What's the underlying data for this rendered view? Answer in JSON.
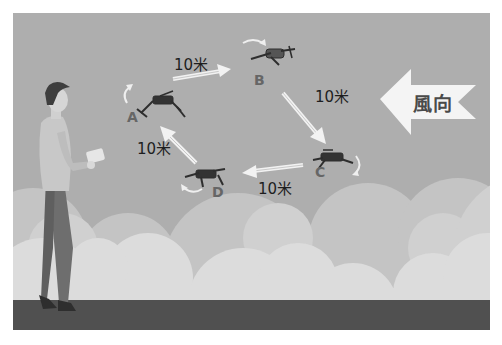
{
  "scene": {
    "description": "Drone square flight pattern A-B-C-D with wind direction",
    "colors": {
      "sky": "#aeaeae",
      "cloud_back": "#c4c4c4",
      "cloud_mid": "#d0d0d0",
      "cloud_front": "#dcdcdc",
      "ground": "#505050",
      "arrow": "#f2f2f2",
      "label_point": "#666666",
      "label_text": "#1e1e1e"
    }
  },
  "waypoints": [
    {
      "id": "A",
      "label": "A"
    },
    {
      "id": "B",
      "label": "B"
    },
    {
      "id": "C",
      "label": "C"
    },
    {
      "id": "D",
      "label": "D"
    }
  ],
  "segments": [
    {
      "from": "A",
      "to": "B",
      "distance": "10米"
    },
    {
      "from": "B",
      "to": "C",
      "distance": "10米"
    },
    {
      "from": "C",
      "to": "D",
      "distance": "10米"
    },
    {
      "from": "D",
      "to": "A",
      "distance": "10米"
    }
  ],
  "wind": {
    "label": "風向",
    "direction": "left",
    "icon": "wind-direction-arrow-icon"
  },
  "figures": {
    "pilot": "person-with-remote-controller",
    "drone_icon": "quadcopter-drone-icon",
    "rotation_icon": "curved-rotation-arrow-icon"
  }
}
